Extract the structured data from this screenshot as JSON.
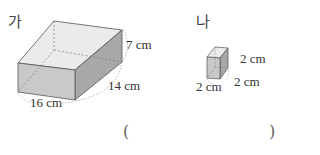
{
  "figures": [
    {
      "name": "가",
      "dimensions": {
        "height": "7 cm",
        "depth": "14 cm",
        "width": "16 cm"
      }
    },
    {
      "name": "나",
      "dimensions": {
        "height": "2 cm",
        "depth": "2 cm",
        "width": "2 cm"
      }
    }
  ],
  "answer": {
    "open": "(",
    "close": ")",
    "value": ""
  },
  "colors": {
    "front": "#c8c8c8",
    "top": "#e9e9e9",
    "side": "#a9a9a9",
    "edge": "#555555"
  }
}
